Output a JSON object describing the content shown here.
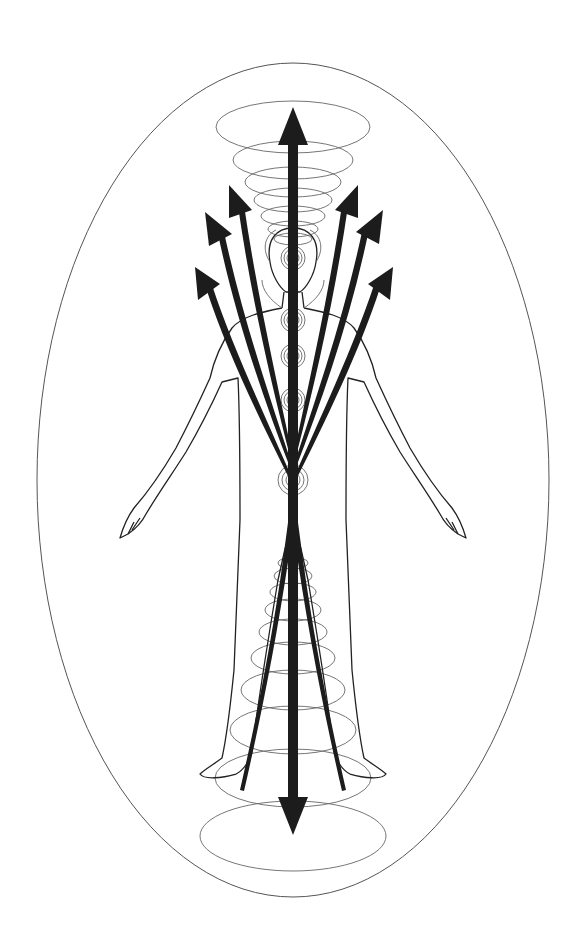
{
  "diagram": {
    "title": "Human energy field with chakras and energy flows",
    "elements": {
      "aura": "outer-ellipse",
      "figure": "human-outline",
      "central_channel": "vertical-double-arrow",
      "upward_flows": [
        "left-outer",
        "left-middle",
        "left-inner",
        "right-inner",
        "right-middle",
        "right-outer"
      ],
      "chakras": [
        "crown",
        "third-eye",
        "throat",
        "heart",
        "solar-plexus",
        "sacral"
      ],
      "crown_vortex": "stacked-ellipses-above-head",
      "root_vortex": "stacked-ellipses-below-pelvis"
    },
    "colors": {
      "background": "#ffffff",
      "arrow": "#1c1c1c",
      "line": "#555555"
    }
  }
}
